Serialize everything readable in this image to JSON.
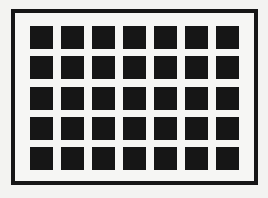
{
  "figure": {
    "name": "Hermann grid",
    "rows": 5,
    "columns": 7,
    "colors": {
      "background": "#f3f3f1",
      "frame_fill": "#f6f6f4",
      "frame_border": "#161616",
      "square": "#161616"
    }
  }
}
